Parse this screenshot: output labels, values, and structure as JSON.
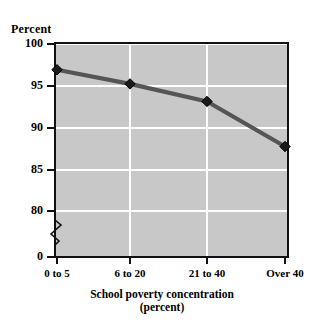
{
  "chart_data": {
    "type": "line",
    "title": "",
    "xlabel": "School poverty concentration (percent)",
    "ylabel": "Percent",
    "categories": [
      "0 to 5",
      "6 to 20",
      "21 to 40",
      "Over 40"
    ],
    "values": [
      96.8,
      95.1,
      93.0,
      87.6
    ],
    "series": [
      {
        "name": "Percent",
        "values": [
          96.8,
          95.1,
          93.0,
          87.6
        ]
      }
    ],
    "ylim": [
      80,
      100
    ],
    "yticks": [
      100,
      95,
      90,
      85,
      80,
      0
    ],
    "ytick_labels": [
      "100",
      "95",
      "90",
      "85",
      "80",
      "0"
    ],
    "xtick_labels": [
      "0 to 5",
      "6 to 20",
      "21 to 40",
      "Over 40"
    ],
    "axis_break": true,
    "axis_break_between": [
      80,
      0
    ],
    "grid": true,
    "grid_color": "#ffffff",
    "plot_background": "#c8c8c8",
    "line_color": "#555555",
    "marker_color": "#1a1a1a",
    "marker": "diamond",
    "legend": false,
    "legend_position": "none"
  },
  "axes": {
    "y_caption": "Percent",
    "x_title_line1": "School poverty concentration",
    "x_title_line2": "(percent)"
  }
}
